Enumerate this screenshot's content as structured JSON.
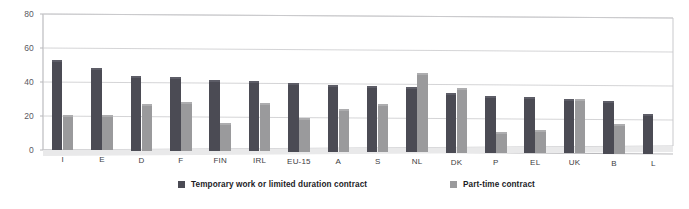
{
  "chart_data": {
    "type": "bar",
    "title": "",
    "xlabel": "",
    "ylabel": "",
    "ylim": [
      0,
      80
    ],
    "yticks": [
      0,
      20,
      40,
      60,
      80
    ],
    "grid": true,
    "legend_position": "bottom",
    "categories": [
      "I",
      "E",
      "D",
      "F",
      "FIN",
      "IRL",
      "EU-15",
      "A",
      "S",
      "NL",
      "DK",
      "P",
      "EL",
      "UK",
      "B",
      "L"
    ],
    "series": [
      {
        "name": "Temporary work or limited duration contract",
        "color": "#4b4b54",
        "values": [
          52,
          47,
          42.5,
          42,
          40.5,
          40,
          39,
          38,
          37.5,
          37,
          34,
          32.5,
          32,
          31,
          30,
          22.5
        ]
      },
      {
        "name": "Part-time contract",
        "color": "#9a9a9c",
        "values": [
          19.5,
          19.5,
          26.5,
          27.5,
          15.5,
          27,
          18.5,
          24,
          27,
          45.5,
          37,
          11,
          12.5,
          31,
          16.5,
          null
        ]
      }
    ]
  },
  "axis": {
    "y_tick_labels": [
      "0",
      "20",
      "40",
      "60",
      "80"
    ]
  },
  "legend": {
    "items": [
      {
        "label": "Temporary work or limited duration contract",
        "swatch": "dark-square-icon"
      },
      {
        "label": "Part-time contract",
        "swatch": "light-square-icon"
      }
    ]
  }
}
